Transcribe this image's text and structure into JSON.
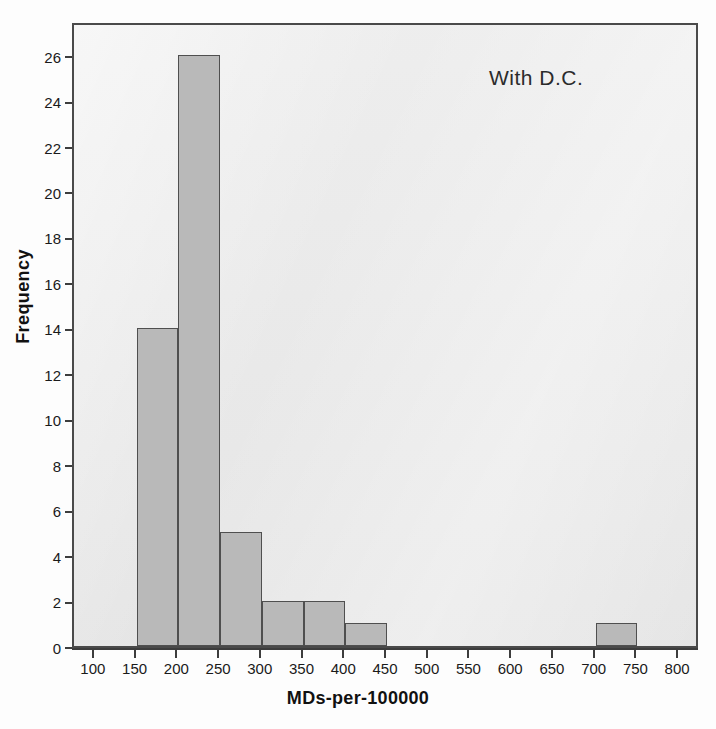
{
  "chart_data": {
    "type": "bar",
    "title": "",
    "annotation": "With D.C.",
    "xlabel": "MDs-per-100000",
    "ylabel": "Frequency",
    "xlim": [
      75,
      825
    ],
    "ylim": [
      0,
      27.5
    ],
    "grid": false,
    "legend": null,
    "bin_width": 50,
    "x_ticks": [
      100,
      150,
      200,
      250,
      300,
      350,
      400,
      450,
      500,
      550,
      600,
      650,
      700,
      750,
      800
    ],
    "x_tick_labels": [
      "100",
      "150",
      "200",
      "250",
      "300",
      "350",
      "400",
      "450",
      "500",
      "550",
      "600",
      "650",
      "700",
      "750",
      "800"
    ],
    "y_ticks": [
      0,
      2,
      4,
      6,
      8,
      10,
      12,
      14,
      16,
      18,
      20,
      22,
      24,
      26
    ],
    "y_tick_labels": [
      "0",
      "2",
      "4",
      "6",
      "8",
      "10",
      "12",
      "14",
      "16",
      "18",
      "20",
      "22",
      "24",
      "26"
    ],
    "bins": [
      {
        "start": 150,
        "end": 200,
        "value": 14
      },
      {
        "start": 200,
        "end": 250,
        "value": 26
      },
      {
        "start": 250,
        "end": 300,
        "value": 5
      },
      {
        "start": 300,
        "end": 350,
        "value": 2
      },
      {
        "start": 350,
        "end": 400,
        "value": 2
      },
      {
        "start": 400,
        "end": 450,
        "value": 1
      },
      {
        "start": 700,
        "end": 750,
        "value": 1
      }
    ],
    "categories": [
      "150-200",
      "200-250",
      "250-300",
      "300-350",
      "350-400",
      "400-450",
      "700-750"
    ],
    "values": [
      14,
      26,
      5,
      2,
      2,
      1,
      1
    ],
    "colors": {
      "bar_fill": "#b9b9b9",
      "bar_edge": "#4f4f4f",
      "plot_background": "#e9e9e9",
      "frame": "#4a4a4a",
      "text": "#1a1a1a",
      "page_background": "#fdfdfd"
    }
  }
}
